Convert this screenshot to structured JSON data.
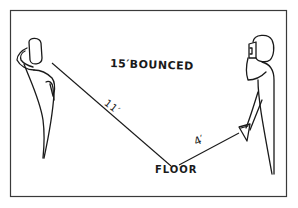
{
  "diagram": {
    "title": "15′BOUNCED",
    "floor_label": "FLOOR",
    "segments": [
      {
        "label": "11′",
        "from": "subject",
        "to": "floor"
      },
      {
        "label": "4′",
        "from": "floor",
        "to": "flash"
      }
    ],
    "figures": [
      "subject",
      "photographer-with-camera-and-flash"
    ],
    "colors": {
      "ink": "#1a1a1a",
      "background": "#ffffff",
      "frame": "#3a3a3a"
    }
  }
}
